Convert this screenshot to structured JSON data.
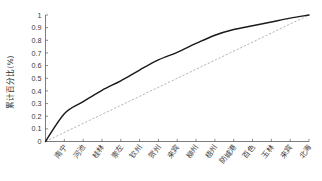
{
  "chart_data": {
    "type": "line",
    "title": "",
    "xlabel": "",
    "ylabel": "累计百分比(%)",
    "ylim": [
      0,
      1
    ],
    "grid": false,
    "legend": "none",
    "categories": [
      "南宁",
      "河池",
      "桂林",
      "崇左",
      "钦州",
      "贺州",
      "来宾",
      "柳州",
      "梧州",
      "防城港",
      "百色",
      "玉林",
      "来宾",
      "北海"
    ],
    "ytick_labels": [
      "0",
      "0.1",
      "0.2",
      "0.3",
      "0.4",
      "0.5",
      "0.6",
      "0.7",
      "0.8",
      "0.9",
      "1"
    ],
    "ytick_values": [
      0,
      0.1,
      0.2,
      0.3,
      0.4,
      0.5,
      0.6,
      0.7,
      0.8,
      0.9,
      1
    ],
    "series": [
      {
        "name": "累计百分比",
        "style": "solid",
        "color": "#1a1a1a",
        "x": [
          0,
          1,
          2,
          3,
          4,
          5,
          6,
          7,
          8,
          9,
          10,
          11,
          12,
          13,
          14
        ],
        "values": [
          0,
          0.22,
          0.315,
          0.405,
          0.48,
          0.565,
          0.645,
          0.705,
          0.775,
          0.84,
          0.885,
          0.915,
          0.945,
          0.975,
          1
        ]
      },
      {
        "name": "均等参考线",
        "style": "dashed",
        "color": "#9a9a9a",
        "x": [
          0,
          14
        ],
        "values": [
          0,
          1
        ]
      }
    ]
  }
}
